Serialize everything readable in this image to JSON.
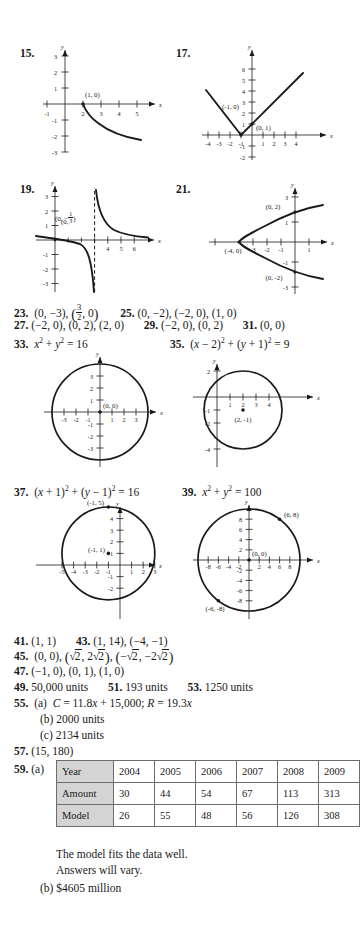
{
  "page": {
    "kind": "textbook-answer-key",
    "background": "#ffffff",
    "ink": "#1a1a1a",
    "table_header_fill": "#d4d4d4"
  },
  "figures": [
    {
      "number": "15.",
      "axis_x_label": "x",
      "axis_y_label": "y",
      "x_ticks": [
        "-1",
        "2",
        "3",
        "4",
        "5"
      ],
      "y_ticks": [
        "3",
        "2",
        "1",
        "-1",
        "-2",
        "-3"
      ],
      "point_labels": [
        "(1, 0)"
      ]
    },
    {
      "number": "17.",
      "axis_x_label": "x",
      "axis_y_label": "y",
      "x_ticks": [
        "-4",
        "-3",
        "-2",
        "-1",
        "1",
        "2",
        "3",
        "4"
      ],
      "y_ticks": [
        "6",
        "5",
        "4",
        "3",
        "2",
        "1",
        "-1",
        "-2"
      ],
      "point_labels": [
        "(-1, 0)",
        "(0, 1)"
      ]
    },
    {
      "number": "19.",
      "axis_x_label": "x",
      "axis_y_label": "y",
      "x_ticks": [
        "4",
        "5",
        "6"
      ],
      "y_ticks": [
        "3",
        "2",
        "1",
        "-1",
        "-2",
        "-3"
      ],
      "point_labels": [
        "(0, -1/3)"
      ],
      "asymptote": "x = 3"
    },
    {
      "number": "21.",
      "axis_x_label": "x",
      "axis_y_label": "y",
      "x_ticks": [
        "-3",
        "-2",
        "-1",
        "1"
      ],
      "y_ticks": [
        "3",
        "1",
        "-1",
        "-3"
      ],
      "point_labels": [
        "(0, 2)",
        "(-4, 0)",
        "(0, -2)"
      ]
    },
    {
      "number": "33-fig",
      "axis_x_label": "x",
      "axis_y_label": "y",
      "x_ticks": [
        "-3",
        "-2",
        "-1",
        "1",
        "2",
        "3"
      ],
      "y_ticks": [
        "3",
        "2",
        "1",
        "-1",
        "-2",
        "-3"
      ],
      "point_labels": [
        "(0, 0)"
      ],
      "circle": {
        "cx": 0,
        "cy": 0,
        "r": 4
      }
    },
    {
      "number": "35-fig",
      "axis_x_label": "x",
      "axis_y_label": "y",
      "x_ticks": [
        "1",
        "2",
        "3",
        "4"
      ],
      "y_ticks": [
        "2",
        "-1",
        "-2",
        "-4"
      ],
      "point_labels": [
        "(2, -1)"
      ],
      "circle": {
        "cx": 2,
        "cy": -1,
        "r": 3
      }
    },
    {
      "number": "37-fig",
      "axis_x_label": "x",
      "axis_y_label": "y",
      "x_ticks": [
        "-5",
        "-4",
        "-3",
        "-2",
        "-1",
        "1",
        "2",
        "3"
      ],
      "y_ticks": [
        "4",
        "3",
        "2",
        "1",
        "-1",
        "-2"
      ],
      "point_labels": [
        "(-1, 5)",
        "(-1, 1)"
      ],
      "circle": {
        "cx": -1,
        "cy": 1,
        "r": 4
      }
    },
    {
      "number": "39-fig",
      "axis_x_label": "x",
      "axis_y_label": "y",
      "x_ticks": [
        "-8",
        "-6",
        "-4",
        "-2",
        "2",
        "4",
        "6",
        "8"
      ],
      "y_ticks": [
        "8",
        "6",
        "4",
        "2",
        "-2",
        "-4",
        "-6",
        "-8"
      ],
      "point_labels": [
        "(6, 8)",
        "(0, 0)",
        "(-6, -8)"
      ],
      "circle": {
        "cx": 0,
        "cy": 0,
        "r": 10
      }
    }
  ],
  "answers": {
    "a23": {
      "num": "23.",
      "text": "(0, −3), (3/2, 0)"
    },
    "a25": {
      "num": "25.",
      "text": "(0, −2), (−2, 0), (1, 0)"
    },
    "a27": {
      "num": "27.",
      "text": "(−2, 0), (0, 2), (2, 0)"
    },
    "a29": {
      "num": "29.",
      "text": "(−2, 0), (0, 2)"
    },
    "a31": {
      "num": "31.",
      "text": "(0, 0)"
    },
    "a33": {
      "num": "33.",
      "text": "x² + y² = 16"
    },
    "a35": {
      "num": "35.",
      "text": "(x − 2)² + (y + 1)² = 9"
    },
    "a37": {
      "num": "37.",
      "text": "(x + 1)² + (y − 1)² = 16"
    },
    "a39": {
      "num": "39.",
      "text": "x² + y² = 100"
    },
    "a41": {
      "num": "41.",
      "text": "(1, 1)"
    },
    "a43": {
      "num": "43.",
      "text": "(1, 14), (−4, −1)"
    },
    "a45": {
      "num": "45.",
      "text": "(0, 0), (√2, 2√2), (−√2, −2√2)"
    },
    "a47": {
      "num": "47.",
      "text": "(−1, 0), (0, 1), (1, 0)"
    },
    "a49": {
      "num": "49.",
      "text": "50,000 units"
    },
    "a51": {
      "num": "51.",
      "text": "193 units"
    },
    "a53": {
      "num": "53.",
      "text": "1250 units"
    },
    "a55": {
      "num": "55.",
      "part_a": "(a)  C = 11.8x + 15,000; R = 19.3x",
      "part_b": "(b)  2000 units",
      "part_c": "(c)  2134 units"
    },
    "a57": {
      "num": "57.",
      "text": "(15, 180)"
    },
    "a59": {
      "num": "59.",
      "part_a_label": "(a)",
      "note_1": "The model fits the data well.",
      "note_2": "Answers will vary.",
      "part_b": "(b)  $4605 million"
    }
  },
  "table": {
    "rows": [
      {
        "header": "Year",
        "values": [
          "2004",
          "2005",
          "2006",
          "2007",
          "2008",
          "2009"
        ]
      },
      {
        "header": "Amount",
        "values": [
          "30",
          "44",
          "54",
          "67",
          "113",
          "313"
        ]
      },
      {
        "header": "Model",
        "values": [
          "26",
          "55",
          "48",
          "56",
          "126",
          "308"
        ]
      }
    ]
  }
}
